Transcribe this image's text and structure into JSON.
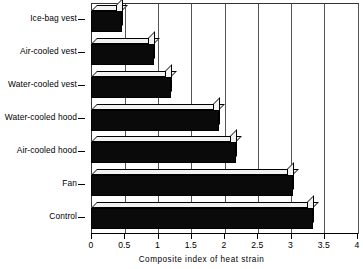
{
  "chart_data": {
    "type": "bar",
    "orientation": "horizontal",
    "style": "3d-extruded",
    "title": "",
    "subtitle": "",
    "xlabel": "Composite index of heat strain",
    "ylabel": "",
    "categories": [
      "Ice-bag vest",
      "Air-cooled vest",
      "Water-cooled vest",
      "Water-cooled hood",
      "Air-cooled hood",
      "Fan",
      "Control"
    ],
    "values": [
      0.47,
      0.95,
      1.2,
      1.93,
      2.18,
      3.04,
      3.34
    ],
    "xlim": [
      0,
      4
    ],
    "xticks": [
      0,
      0.5,
      1,
      1.5,
      2,
      2.5,
      3,
      3.5,
      4
    ],
    "xticklabels": [
      "0",
      "0.5",
      "1",
      "1.5",
      "2",
      "2.5",
      "3",
      "3.5",
      "4"
    ],
    "grid": "vertical",
    "legend": null,
    "annotations": [],
    "colors": {
      "bar_face": "#0a0a0a",
      "bar_highlight": "#f2f2f2",
      "axis": "#000000",
      "grid": "#555555",
      "background": "#ffffff"
    }
  }
}
